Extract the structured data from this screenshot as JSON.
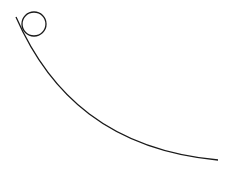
{
  "diagram": {
    "width": 225,
    "height": 171,
    "background": "#ffffff",
    "stroke_color": "#1a1a1a",
    "circle": {
      "cx": 34,
      "cy": 24,
      "r": 12
    },
    "curve": {
      "start": [
        16,
        17
      ],
      "control1": [
        50,
        95
      ],
      "control2": [
        110,
        150
      ],
      "end": [
        218,
        160
      ]
    }
  }
}
